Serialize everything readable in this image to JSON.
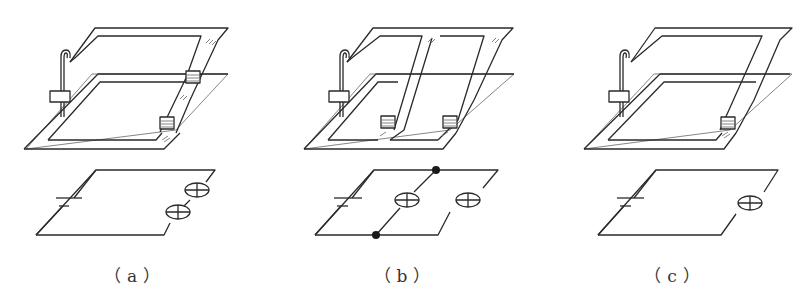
{
  "figure": {
    "panels": [
      {
        "id": "a",
        "caption": "（a）",
        "description": "Strip conductor connecting two lamp holders in series",
        "lamps": 2,
        "connection": "series"
      },
      {
        "id": "b",
        "caption": "（b）",
        "description": "Strip conductors connecting two lamp holders in parallel",
        "lamps": 2,
        "connection": "parallel"
      },
      {
        "id": "c",
        "caption": "（c）",
        "description": "Strip conductor connecting a single lamp holder",
        "lamps": 1,
        "connection": "single"
      }
    ],
    "components": {
      "switch": "switch-icon",
      "lamp_holder": "lamp-holder-icon",
      "battery": "battery-symbol-icon",
      "lamp": "lamp-symbol-icon",
      "junction": "junction-dot-icon"
    },
    "colors": {
      "line": "#2a2a2a",
      "background": "#ffffff"
    }
  }
}
